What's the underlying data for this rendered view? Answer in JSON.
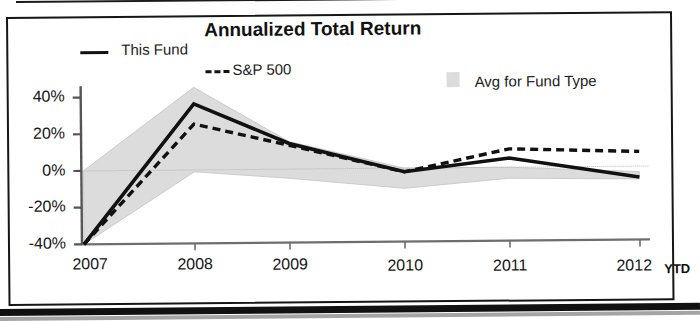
{
  "chart_data": {
    "type": "line",
    "title": "Annualized Total Return",
    "xlabel": "",
    "ylabel": "",
    "grid": false,
    "legend_position": "top",
    "ylim": [
      -40,
      45
    ],
    "yticks": [
      40,
      20,
      0,
      -20,
      -40
    ],
    "ytick_labels": [
      "40%",
      "20%",
      "0%",
      "-20%",
      "-40%"
    ],
    "categories": [
      "2007",
      "2008",
      "2009",
      "2010",
      "2011",
      "2012"
    ],
    "x_note": "YTD",
    "zero_line": 0,
    "series": [
      {
        "name": "This Fund",
        "style": "solid",
        "color": "#111111",
        "values": [
          -40,
          36,
          14,
          -2,
          5,
          -6
        ]
      },
      {
        "name": "S&P 500",
        "style": "dashed",
        "color": "#111111",
        "values": [
          -40,
          25,
          13,
          -2,
          10,
          8
        ]
      }
    ],
    "band": {
      "name": "Avg for Fund Type",
      "color": "#dcdcdc",
      "upper": [
        0,
        45,
        15,
        0,
        0,
        -3
      ],
      "lower": [
        -40,
        -1,
        -5,
        -11,
        -6,
        -7
      ]
    }
  },
  "legend": {
    "fund_label": "This Fund",
    "sp_label": "S&P 500",
    "avg_label": "Avg for Fund Type"
  },
  "axis": {
    "y_labels": [
      "40%",
      "20%",
      "0%",
      "-20%",
      "-40%"
    ],
    "x_labels": [
      "2007",
      "2008",
      "2009",
      "2010",
      "2011",
      "2012"
    ],
    "ytd": "YTD"
  },
  "colors": {
    "line": "#111111",
    "band": "#dcdcdc",
    "axis": "#4a4a4a",
    "text": "#161616"
  }
}
